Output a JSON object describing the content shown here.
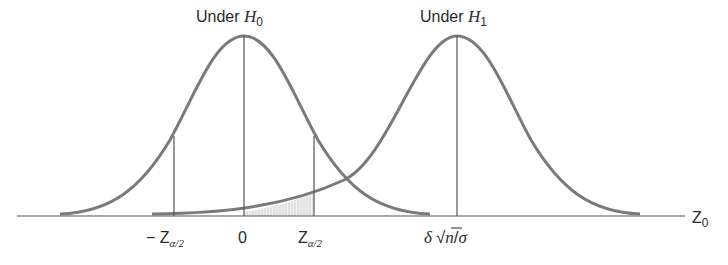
{
  "diagram": {
    "colors": {
      "curve": "#7a7a7a",
      "line": "#555555",
      "axis": "#8a8a8a",
      "shade": "#d9d9d9",
      "text": "#2a2a2a"
    },
    "curves": [
      {
        "id": "h0",
        "label_prefix": "Under ",
        "label_var": "H",
        "label_sub": "0",
        "center_label": "0"
      },
      {
        "id": "h1",
        "label_prefix": "Under ",
        "label_var": "H",
        "label_sub": "1",
        "center_label": "δ √n/σ"
      }
    ],
    "axis": {
      "label_var": "Z",
      "label_sub": "0"
    },
    "ticks": [
      {
        "id": "neg-crit",
        "prefix": "− ",
        "var": "Z",
        "sub": "α/2"
      },
      {
        "id": "zero",
        "text": "0"
      },
      {
        "id": "pos-crit",
        "prefix": "",
        "var": "Z",
        "sub": "α/2"
      },
      {
        "id": "shift",
        "delta": "δ",
        "sqrt": "√",
        "n": "n",
        "slash": "/",
        "sigma": "σ"
      }
    ],
    "shaded_region": "β region: area under H1 curve between 0 and Zα/2"
  }
}
